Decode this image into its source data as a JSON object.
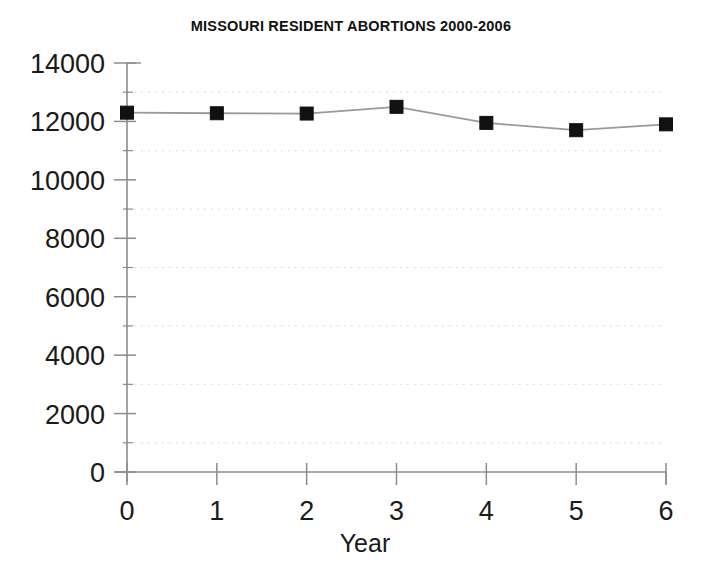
{
  "chart_data": {
    "type": "line",
    "title": "MISSOURI RESIDENT ABORTIONS 2000-2006",
    "xlabel": "Year",
    "ylabel": "",
    "x": [
      0,
      1,
      2,
      3,
      4,
      5,
      6
    ],
    "values": [
      12300,
      12280,
      12270,
      12500,
      11950,
      11700,
      11900
    ],
    "series": [
      {
        "name": "Missouri resident abortions",
        "values": [
          12300,
          12280,
          12270,
          12500,
          11950,
          11700,
          11900
        ]
      }
    ],
    "xlim": [
      0,
      6
    ],
    "ylim": [
      0,
      14000
    ],
    "x_tick_labels": [
      "0",
      "1",
      "2",
      "3",
      "4",
      "5",
      "6"
    ],
    "y_tick_labels": [
      "0",
      "2000",
      "4000",
      "6000",
      "8000",
      "10000",
      "12000",
      "14000"
    ],
    "y_tick_values": [
      0,
      2000,
      4000,
      6000,
      8000,
      10000,
      12000,
      14000
    ],
    "y_minor_tick_values": [
      1000,
      3000,
      5000,
      7000,
      9000,
      11000,
      13000
    ],
    "grid": "minor-horizontal-dotted",
    "legend": "none",
    "marker": "square",
    "marker_color": "#111111",
    "line_color": "#9a9a9a",
    "axis_color": "#8c8c8c",
    "grid_color": "#c8c8d4",
    "background": "#ffffff"
  }
}
